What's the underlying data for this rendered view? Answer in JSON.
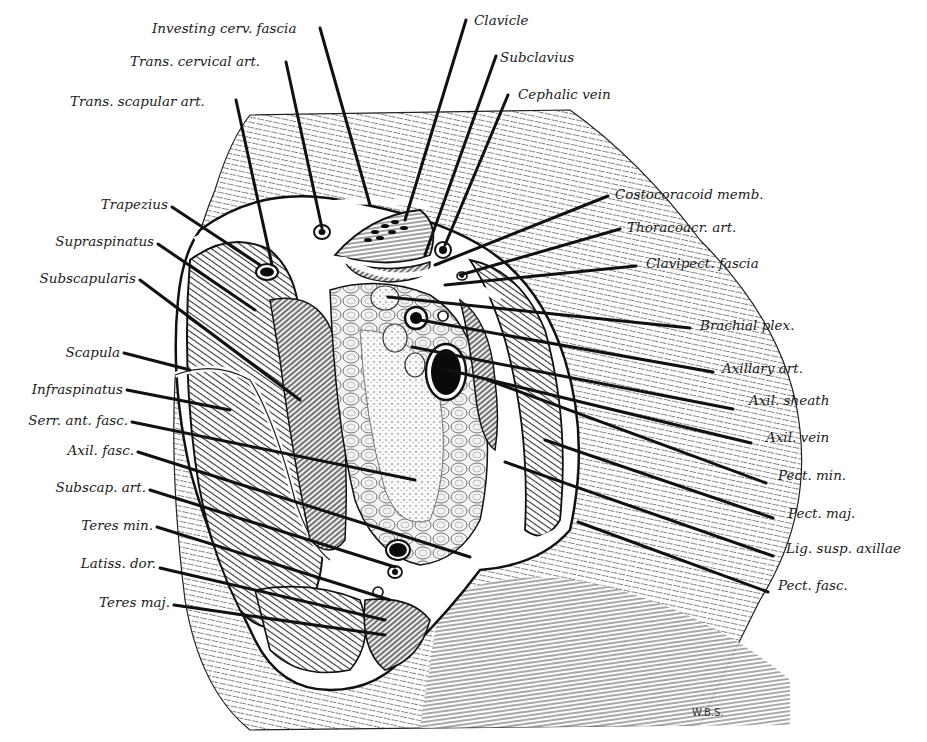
{
  "figure": {
    "signature": "W.B.S.",
    "colors": {
      "ink": "#111111",
      "paper": "#ffffff",
      "hatch": "#555555"
    }
  },
  "labels": [
    {
      "id": "investing-cerv-fascia",
      "text": "Investing cerv. fascia",
      "x": 152,
      "y": 33,
      "anchor": "start",
      "line": [
        [
          320,
          28
        ],
        [
          370,
          205
        ]
      ]
    },
    {
      "id": "trans-cervical-art",
      "text": "Trans. cervical art.",
      "x": 130,
      "y": 66,
      "anchor": "start",
      "line": [
        [
          286,
          62
        ],
        [
          322,
          228
        ]
      ]
    },
    {
      "id": "trans-scapular-art",
      "text": "Trans. scapular art.",
      "x": 70,
      "y": 106,
      "anchor": "start",
      "line": [
        [
          236,
          100
        ],
        [
          272,
          265
        ]
      ]
    },
    {
      "id": "clavicle",
      "text": "Clavicle",
      "x": 474,
      "y": 25,
      "anchor": "start",
      "line": [
        [
          466,
          20
        ],
        [
          405,
          220
        ]
      ]
    },
    {
      "id": "subclavius",
      "text": "Subclavius",
      "x": 500,
      "y": 62,
      "anchor": "start",
      "line": [
        [
          496,
          56
        ],
        [
          425,
          255
        ]
      ]
    },
    {
      "id": "cephalic-vein",
      "text": "Cephalic vein",
      "x": 518,
      "y": 99,
      "anchor": "start",
      "line": [
        [
          508,
          95
        ],
        [
          445,
          245
        ]
      ]
    },
    {
      "id": "costocoracoid-memb",
      "text": "Costocoracoid memb.",
      "x": 615,
      "y": 199,
      "anchor": "start",
      "line": [
        [
          608,
          196
        ],
        [
          435,
          265
        ]
      ]
    },
    {
      "id": "thoracoacr-art",
      "text": "Thoracoacr. art.",
      "x": 627,
      "y": 232,
      "anchor": "start",
      "line": [
        [
          620,
          229
        ],
        [
          460,
          275
        ]
      ]
    },
    {
      "id": "clavipect-fascia",
      "text": "Clavipect. fascia",
      "x": 646,
      "y": 268,
      "anchor": "start",
      "line": [
        [
          636,
          266
        ],
        [
          445,
          285
        ]
      ]
    },
    {
      "id": "brachial-plex",
      "text": "Brachial plex.",
      "x": 700,
      "y": 330,
      "anchor": "start",
      "line": [
        [
          690,
          328
        ],
        [
          388,
          297
        ]
      ]
    },
    {
      "id": "axillary-art",
      "text": "Axillary art.",
      "x": 722,
      "y": 373,
      "anchor": "start",
      "line": [
        [
          713,
          372
        ],
        [
          420,
          320
        ]
      ]
    },
    {
      "id": "axil-sheath",
      "text": "Axil. sheath",
      "x": 749,
      "y": 405,
      "anchor": "start",
      "line": [
        [
          733,
          409
        ],
        [
          412,
          347
        ]
      ]
    },
    {
      "id": "axil-vein",
      "text": "Axil. vein",
      "x": 766,
      "y": 442,
      "anchor": "start",
      "line": [
        [
          751,
          443
        ],
        [
          440,
          368
        ]
      ]
    },
    {
      "id": "pect-min",
      "text": "Pect. min.",
      "x": 778,
      "y": 480,
      "anchor": "start",
      "line": [
        [
          766,
          483
        ],
        [
          488,
          380
        ]
      ]
    },
    {
      "id": "pect-maj",
      "text": "Pect. maj.",
      "x": 788,
      "y": 518,
      "anchor": "start",
      "line": [
        [
          773,
          518
        ],
        [
          545,
          440
        ]
      ]
    },
    {
      "id": "lig-susp-axillae",
      "text": "Lig. susp. axillae",
      "x": 786,
      "y": 553,
      "anchor": "start",
      "line": [
        [
          773,
          556
        ],
        [
          505,
          462
        ]
      ]
    },
    {
      "id": "pect-fasc",
      "text": "Pect. fasc.",
      "x": 778,
      "y": 590,
      "anchor": "start",
      "line": [
        [
          768,
          592
        ],
        [
          578,
          522
        ]
      ]
    },
    {
      "id": "trapezius",
      "text": "Trapezius",
      "x": 86,
      "y": 209,
      "anchor": "start",
      "line": [
        [
          172,
          207
        ],
        [
          260,
          265
        ]
      ]
    },
    {
      "id": "supraspinatus",
      "text": "Supraspinatus",
      "x": 37,
      "y": 246,
      "anchor": "start",
      "line": [
        [
          158,
          244
        ],
        [
          255,
          310
        ]
      ]
    },
    {
      "id": "subscapularis",
      "text": "Subscapularis",
      "x": 25,
      "y": 283,
      "anchor": "start",
      "line": [
        [
          140,
          280
        ],
        [
          300,
          400
        ]
      ]
    },
    {
      "id": "scapula",
      "text": "Scapula",
      "x": 55,
      "y": 357,
      "anchor": "start",
      "line": [
        [
          124,
          353
        ],
        [
          190,
          370
        ]
      ]
    },
    {
      "id": "infraspinatus",
      "text": "Infraspinatus",
      "x": 18,
      "y": 394,
      "anchor": "start",
      "line": [
        [
          127,
          390
        ],
        [
          230,
          410
        ]
      ]
    },
    {
      "id": "serr-ant-fasc",
      "text": "Serr. ant. fasc.",
      "x": 18,
      "y": 425,
      "anchor": "start",
      "line": [
        [
          132,
          422
        ],
        [
          415,
          480
        ]
      ]
    },
    {
      "id": "axil-fasc",
      "text": "Axil. fasc.",
      "x": 56,
      "y": 455,
      "anchor": "start",
      "line": [
        [
          138,
          452
        ],
        [
          470,
          557
        ]
      ]
    },
    {
      "id": "subscap-art",
      "text": "Subscap. art.",
      "x": 47,
      "y": 492,
      "anchor": "start",
      "line": [
        [
          150,
          490
        ],
        [
          395,
          567
        ]
      ]
    },
    {
      "id": "teres-min",
      "text": "Teres min.",
      "x": 74,
      "y": 530,
      "anchor": "start",
      "line": [
        [
          157,
          527
        ],
        [
          390,
          600
        ]
      ]
    },
    {
      "id": "latiss-dor",
      "text": "Latiss. dor.",
      "x": 67,
      "y": 568,
      "anchor": "start",
      "line": [
        [
          160,
          568
        ],
        [
          385,
          620
        ]
      ]
    },
    {
      "id": "teres-maj",
      "text": "Teres maj.",
      "x": 92,
      "y": 607,
      "anchor": "start",
      "line": [
        [
          174,
          605
        ],
        [
          385,
          635
        ]
      ]
    }
  ]
}
